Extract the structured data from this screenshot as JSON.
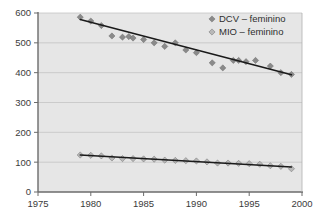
{
  "figure": {
    "background_color": "#ffffff",
    "plot_background_color": "#e6e6e6",
    "axis_color": "#6b6b6b",
    "gridline_color": "#c4c4c4",
    "trendline_color": "#1a1a1a"
  },
  "legend": {
    "position": "top-right-inside",
    "entries": [
      {
        "label": "DCV – feminino",
        "marker": "diamond-icon",
        "color": "#8a8a8a"
      },
      {
        "label": "MIO – feminino",
        "marker": "diamond-icon",
        "color": "#b8b8b8"
      }
    ]
  },
  "axes": {
    "y": {
      "min": 0,
      "max": 600,
      "step": 100,
      "ticks": [
        "0",
        "100",
        "200",
        "300",
        "400",
        "500",
        "600"
      ],
      "label": ""
    },
    "x": {
      "min": 1975,
      "max": 2000,
      "step": 5,
      "ticks": [
        "1975",
        "1980",
        "1985",
        "1990",
        "1995",
        "2000"
      ],
      "label": ""
    }
  },
  "chart_data": {
    "type": "scatter",
    "title": "",
    "subtitle": "",
    "xlabel": "",
    "ylabel": "",
    "xlim": [
      1975,
      2000
    ],
    "ylim": [
      0,
      600
    ],
    "grid": true,
    "legend_position": "upper right",
    "series": [
      {
        "name": "DCV – feminino",
        "marker": "diamond",
        "color": "#8a8a8a",
        "trendline": true,
        "trendline_start": {
          "x": 1979,
          "y": 578
        },
        "trendline_end": {
          "x": 1999,
          "y": 393
        },
        "x": [
          1979,
          1980,
          1981,
          1982,
          1983,
          1983.6,
          1984,
          1985,
          1986,
          1987,
          1988,
          1989,
          1990,
          1991.5,
          1992.5,
          1993.5,
          1994,
          1994.7,
          1995.6,
          1997,
          1998,
          1999
        ],
        "y": [
          586,
          573,
          558,
          523,
          519,
          521,
          516,
          511,
          500,
          488,
          500,
          476,
          467,
          433,
          416,
          441,
          441,
          437,
          441,
          422,
          400,
          394
        ]
      },
      {
        "name": "MIO – feminino",
        "marker": "diamond",
        "color": "#b8b8b8",
        "trendline": true,
        "trendline_start": {
          "x": 1979,
          "y": 124
        },
        "trendline_end": {
          "x": 1999,
          "y": 84
        },
        "x": [
          1979,
          1980,
          1981,
          1982,
          1983,
          1984,
          1985,
          1986,
          1987,
          1988,
          1989,
          1990,
          1991,
          1992,
          1993,
          1994,
          1995,
          1996,
          1997,
          1998,
          1999
        ],
        "y": [
          124,
          123,
          121,
          114,
          112,
          112,
          111,
          110,
          107,
          106,
          105,
          104,
          101,
          97,
          97,
          96,
          95,
          93,
          88,
          86,
          78
        ]
      }
    ]
  }
}
